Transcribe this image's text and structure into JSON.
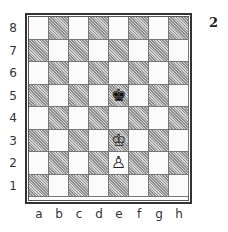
{
  "diagram": {
    "number": "2",
    "ranks": [
      "8",
      "7",
      "6",
      "5",
      "4",
      "3",
      "2",
      "1"
    ],
    "files": [
      "a",
      "b",
      "c",
      "d",
      "e",
      "f",
      "g",
      "h"
    ],
    "top_left_square_color": "light",
    "pieces": [
      {
        "square": "e5",
        "color": "black",
        "type": "king",
        "glyph": "♚",
        "icon": "black-king-icon"
      },
      {
        "square": "e3",
        "color": "white",
        "type": "king",
        "glyph": "♔",
        "icon": "white-king-icon"
      },
      {
        "square": "e2",
        "color": "white",
        "type": "pawn",
        "glyph": "♙",
        "icon": "white-pawn-icon"
      }
    ],
    "fen": "8/8/8/4k3/8/4K3/4P3/8"
  },
  "colors": {
    "light_square": "#fbfbfb",
    "dark_square_hatch": "#8a8a8a",
    "border": "#333333"
  }
}
